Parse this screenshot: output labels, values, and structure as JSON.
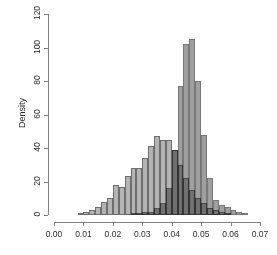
{
  "chart_data": {
    "type": "bar",
    "subtype": "overlaid-histogram",
    "title": "",
    "xlabel": "",
    "ylabel": "Density",
    "xlim": [
      0.0,
      0.07
    ],
    "ylim": [
      0,
      120
    ],
    "grid": false,
    "legend": "none",
    "xticks": [
      "0.00",
      "0.01",
      "0.02",
      "0.03",
      "0.04",
      "0.05",
      "0.06",
      "0.07"
    ],
    "xtick_values": [
      0.0,
      0.01,
      0.02,
      0.03,
      0.04,
      0.05,
      0.06,
      0.07
    ],
    "yticks": [
      "0",
      "20",
      "40",
      "60",
      "80",
      "100",
      "120"
    ],
    "ytick_values": [
      0,
      20,
      40,
      60,
      80,
      100,
      120
    ],
    "bin_width": 0.002,
    "colors": {
      "series_a": "#b4b4b4",
      "series_b": "#8a8a8a",
      "border": "#6e6e6e",
      "axis": "#808080",
      "text": "#2b2b2b",
      "background": "#ffffff"
    },
    "series": [
      {
        "name": "Distribution A",
        "color": "#b4b4b4",
        "bins": [
          {
            "x0": 0.008,
            "x1": 0.01,
            "y": 1
          },
          {
            "x0": 0.01,
            "x1": 0.012,
            "y": 2
          },
          {
            "x0": 0.012,
            "x1": 0.014,
            "y": 3
          },
          {
            "x0": 0.014,
            "x1": 0.016,
            "y": 5
          },
          {
            "x0": 0.016,
            "x1": 0.018,
            "y": 8
          },
          {
            "x0": 0.018,
            "x1": 0.02,
            "y": 10
          },
          {
            "x0": 0.02,
            "x1": 0.022,
            "y": 18
          },
          {
            "x0": 0.022,
            "x1": 0.024,
            "y": 17
          },
          {
            "x0": 0.024,
            "x1": 0.026,
            "y": 23
          },
          {
            "x0": 0.026,
            "x1": 0.028,
            "y": 28
          },
          {
            "x0": 0.028,
            "x1": 0.03,
            "y": 28
          },
          {
            "x0": 0.03,
            "x1": 0.032,
            "y": 34
          },
          {
            "x0": 0.032,
            "x1": 0.034,
            "y": 41
          },
          {
            "x0": 0.034,
            "x1": 0.036,
            "y": 47
          },
          {
            "x0": 0.036,
            "x1": 0.038,
            "y": 45
          },
          {
            "x0": 0.038,
            "x1": 0.04,
            "y": 45
          },
          {
            "x0": 0.04,
            "x1": 0.042,
            "y": 39
          },
          {
            "x0": 0.042,
            "x1": 0.044,
            "y": 30
          },
          {
            "x0": 0.044,
            "x1": 0.046,
            "y": 22
          },
          {
            "x0": 0.046,
            "x1": 0.048,
            "y": 15
          },
          {
            "x0": 0.048,
            "x1": 0.05,
            "y": 10
          },
          {
            "x0": 0.05,
            "x1": 0.052,
            "y": 7
          },
          {
            "x0": 0.052,
            "x1": 0.054,
            "y": 4
          },
          {
            "x0": 0.054,
            "x1": 0.056,
            "y": 3
          },
          {
            "x0": 0.056,
            "x1": 0.058,
            "y": 2
          },
          {
            "x0": 0.058,
            "x1": 0.06,
            "y": 1
          }
        ]
      },
      {
        "name": "Distribution B",
        "color": "#8a8a8a",
        "bins": [
          {
            "x0": 0.026,
            "x1": 0.028,
            "y": 1
          },
          {
            "x0": 0.028,
            "x1": 0.03,
            "y": 1
          },
          {
            "x0": 0.03,
            "x1": 0.032,
            "y": 2
          },
          {
            "x0": 0.032,
            "x1": 0.034,
            "y": 2
          },
          {
            "x0": 0.034,
            "x1": 0.036,
            "y": 4
          },
          {
            "x0": 0.036,
            "x1": 0.038,
            "y": 7
          },
          {
            "x0": 0.038,
            "x1": 0.04,
            "y": 16
          },
          {
            "x0": 0.04,
            "x1": 0.042,
            "y": 39
          },
          {
            "x0": 0.042,
            "x1": 0.044,
            "y": 77
          },
          {
            "x0": 0.044,
            "x1": 0.046,
            "y": 102
          },
          {
            "x0": 0.046,
            "x1": 0.048,
            "y": 105
          },
          {
            "x0": 0.048,
            "x1": 0.05,
            "y": 80
          },
          {
            "x0": 0.05,
            "x1": 0.052,
            "y": 48
          },
          {
            "x0": 0.052,
            "x1": 0.054,
            "y": 22
          },
          {
            "x0": 0.054,
            "x1": 0.056,
            "y": 9
          },
          {
            "x0": 0.056,
            "x1": 0.058,
            "y": 6
          },
          {
            "x0": 0.058,
            "x1": 0.06,
            "y": 5
          },
          {
            "x0": 0.06,
            "x1": 0.062,
            "y": 3
          },
          {
            "x0": 0.062,
            "x1": 0.064,
            "y": 2
          },
          {
            "x0": 0.064,
            "x1": 0.066,
            "y": 1
          }
        ]
      }
    ]
  },
  "geometry": {
    "x_pixel_at_min": 54,
    "x_pixel_at_max": 260,
    "y_pixel_at_zero": 215,
    "y_pixel_at_max": 14,
    "axis_x_position": 48,
    "axis_y_position": 222
  }
}
